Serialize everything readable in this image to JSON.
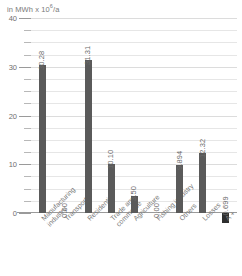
{
  "axis_unit_prefix": "in MWh x 10",
  "axis_unit_exp": "6",
  "axis_unit_suffix": "/a",
  "chart_data": {
    "type": "bar",
    "title": "",
    "subtitle": "",
    "xlabel": "",
    "ylabel": "in MWh x 10^6/a",
    "ylim": [
      0,
      40
    ],
    "yticks": [
      0,
      10,
      20,
      30,
      40
    ],
    "ytick_labels": [
      "0",
      "10",
      "20",
      "30",
      "40"
    ],
    "minor_ticks": [
      2.5,
      5,
      7.5,
      12.5,
      15,
      17.5,
      22.5,
      25,
      27.5,
      32.5,
      35,
      37.5
    ],
    "grid": true,
    "legend": "none",
    "categories": [
      "Manufacturing industry",
      "Transport",
      "Residential",
      "Trade and commerce",
      "Agriculture",
      "Fishing industry",
      "Others",
      "Losses",
      "A +"
    ],
    "category_lines": [
      [
        "Manufacturing",
        "industry"
      ],
      [
        "Transport"
      ],
      [
        "Residential"
      ],
      [
        "Trade and",
        "commerce"
      ],
      [
        "Agriculture"
      ],
      [
        "Fishing industry"
      ],
      [
        "Others"
      ],
      [
        "Losses"
      ],
      [
        "A +"
      ]
    ],
    "values": [
      30.28,
      0.0,
      31.31,
      10.1,
      3.5,
      0.0,
      9.894,
      12.32,
      -0.699
    ],
    "value_labels": [
      "30.28",
      "0.00",
      "31.31",
      "10.10",
      "3.50",
      "0.00",
      "9.894",
      "12.32",
      "-0.699"
    ],
    "bar_color": "#5a5a5a",
    "negative_bar_color": "#2e2e2e"
  }
}
